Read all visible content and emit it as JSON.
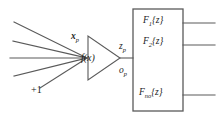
{
  "figure": {
    "kind": "neuron-block-diagram",
    "background_color": "#ffffff",
    "line_color": "#5a5a5a",
    "text_color": "#1b1b1b"
  },
  "labels": {
    "input_vector": {
      "base": "x",
      "sub": "p",
      "text": "x_p"
    },
    "activation": {
      "text": "f(x)"
    },
    "net_output": {
      "base": "z",
      "sub": "p",
      "text": "z_p"
    },
    "neuron_output": {
      "base": "o",
      "sub": "p",
      "text": "o_p"
    },
    "bias": {
      "text": "+1"
    }
  },
  "filters": [
    {
      "base": "F",
      "sub": "1",
      "arg": "z",
      "text": "F_1{z}"
    },
    {
      "base": "F",
      "sub": "2",
      "arg": "z",
      "text": "F_2{z}"
    },
    {
      "base": "F",
      "sub": "no",
      "arg": "z",
      "text": "F_no{z}"
    }
  ],
  "counts": {
    "input_lines": 5,
    "output_lines": 3
  }
}
